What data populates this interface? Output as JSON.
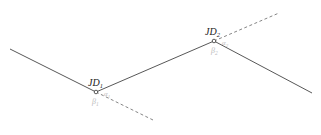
{
  "diagram": {
    "type": "route-alignment-intersection-points",
    "colors": {
      "line": "#444444",
      "dashed": "#666666",
      "label": "#222222",
      "angle_label": "#bbbbbb"
    },
    "points": [
      {
        "id": "JD1",
        "label_main": "JD",
        "label_sub": "1",
        "alpha_main": "α",
        "alpha_sub": "1",
        "beta_main": "β",
        "beta_sub": "1"
      },
      {
        "id": "JD2",
        "label_main": "JD",
        "label_sub": "2",
        "alpha_main": "α",
        "alpha_sub": "2",
        "beta_main": "β",
        "beta_sub": "2"
      }
    ]
  }
}
